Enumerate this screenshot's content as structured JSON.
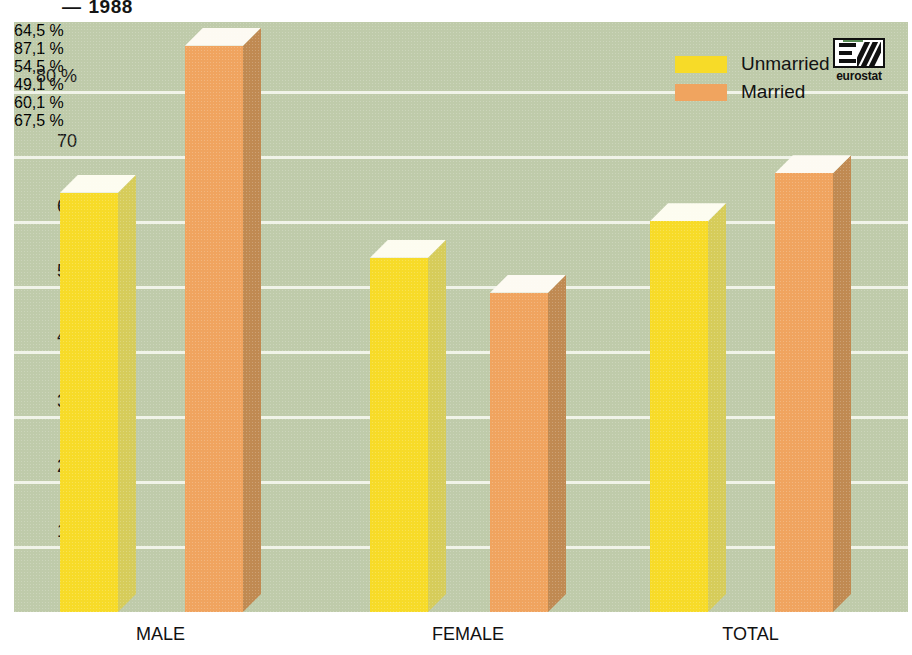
{
  "title": {
    "dash": "—",
    "text": "1988"
  },
  "legend": {
    "position": "top-right",
    "items": [
      {
        "label": "Unmarried",
        "color": "#f7db28",
        "icon": "legend-swatch-icon"
      },
      {
        "label": "Married",
        "color": "#f0a45f",
        "icon": "legend-swatch-icon"
      }
    ]
  },
  "logo": {
    "name": "eurostat",
    "icon": "eurostat-logo-icon"
  },
  "colors": {
    "background": "#bfcbaa",
    "gridline": "#f4f6ee",
    "unmarried_front": "#f7db28",
    "unmarried_side": "#d6cc5a",
    "unmarried_top": "#fdfcf0",
    "married_front": "#f0a45f",
    "married_side": "#c08a52",
    "married_top": "#fdfaf2",
    "text": "#121212"
  },
  "chart_data": {
    "type": "bar",
    "title": "— 1988",
    "xlabel": "",
    "ylabel": "%",
    "ylim": [
      0,
      85
    ],
    "grid": true,
    "categories": [
      "MALE",
      "FEMALE",
      "TOTAL"
    ],
    "yticks": [
      "0",
      "10",
      "20",
      "30",
      "40",
      "50",
      "60",
      "70",
      "80 %"
    ],
    "ytick_values": [
      0,
      10,
      20,
      30,
      40,
      50,
      60,
      70,
      80
    ],
    "series": [
      {
        "name": "Unmarried",
        "color": "#f7db28",
        "values": [
          64.5,
          54.5,
          60.1
        ],
        "data_labels": [
          "64,5 %",
          "54,5 %",
          "60,1 %"
        ]
      },
      {
        "name": "Married",
        "color": "#f0a45f",
        "values": [
          87.1,
          49.1,
          67.5
        ],
        "data_labels": [
          "87,1 %",
          "49,1 %",
          "67,5 %"
        ]
      }
    ]
  }
}
